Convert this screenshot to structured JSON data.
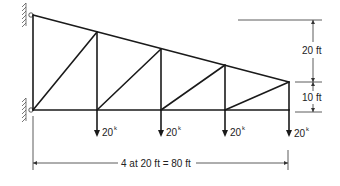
{
  "diagram": {
    "type": "cantilever truss",
    "loads": [
      {
        "label": "20",
        "unit": "k"
      },
      {
        "label": "20",
        "unit": "k"
      },
      {
        "label": "20",
        "unit": "k"
      },
      {
        "label": "20",
        "unit": "k"
      }
    ],
    "dimensions": {
      "top_height": "20 ft",
      "end_height": "10 ft",
      "span": "4 at 20 ft = 80 ft"
    }
  }
}
